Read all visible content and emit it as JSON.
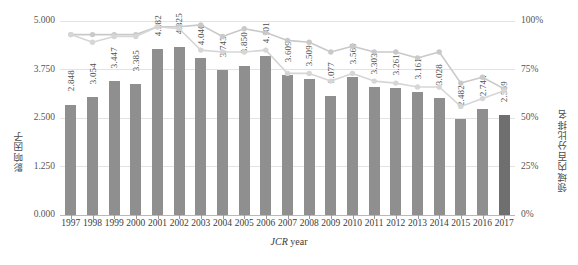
{
  "chart_data": {
    "type": "bar",
    "title": "",
    "xlabel_italic": "JCR",
    "xlabel_rest": " year",
    "ylabel_left": "影响因子",
    "ylabel_right": "领域内百分比排名",
    "grid": true,
    "legend_position": "none",
    "categories": [
      "1997",
      "1998",
      "1999",
      "2000",
      "2001",
      "2002",
      "2003",
      "2004",
      "2005",
      "2006",
      "2007",
      "2008",
      "2009",
      "2010",
      "2011",
      "2012",
      "2013",
      "2014",
      "2015",
      "2016",
      "2017"
    ],
    "values": [
      2.848,
      3.054,
      3.447,
      3.385,
      4.282,
      4.325,
      4.04,
      3.743,
      3.85,
      4.101,
      3.609,
      3.509,
      3.077,
      3.569,
      3.303,
      3.261,
      3.161,
      3.028,
      2.482,
      2.744,
      2.569
    ],
    "value_labels": [
      "2.848",
      "3.054",
      "3.447",
      "3.385",
      "4.282",
      "4.325",
      "4.040",
      "3.743",
      "3.850",
      "4.101",
      "3.609",
      "3.509",
      "3.077",
      "3.569",
      "3.303",
      "3.261",
      "3.161",
      "3.028",
      "2.482",
      "2.744",
      "2.569"
    ],
    "ylim": [
      0,
      5.0
    ],
    "yticks": [
      0,
      1.25,
      2.5,
      3.75,
      5.0
    ],
    "ytick_labels": [
      "0.000",
      "1.250",
      "2.500",
      "3.750",
      "5.000"
    ],
    "y2lim": [
      0,
      100
    ],
    "y2ticks": [
      0,
      25,
      50,
      75,
      100
    ],
    "y2tick_labels": [
      "0%",
      "25%",
      "50%",
      "75%",
      "100%"
    ],
    "series": [
      {
        "name": "percentile-upper",
        "axis": "right",
        "color": "#c9c9c9",
        "values": [
          93,
          93,
          93,
          93,
          97,
          97,
          98,
          92,
          96,
          94,
          90,
          89,
          84,
          87,
          84,
          84,
          81,
          84,
          68,
          71,
          65
        ]
      },
      {
        "name": "percentile-lower",
        "axis": "right",
        "color": "#d6d6d6",
        "values": [
          93,
          89,
          92,
          92,
          97,
          96,
          85,
          84,
          84,
          85,
          73,
          73,
          69,
          73,
          69,
          68,
          66,
          66,
          56,
          60,
          64
        ]
      }
    ]
  },
  "caption": ""
}
